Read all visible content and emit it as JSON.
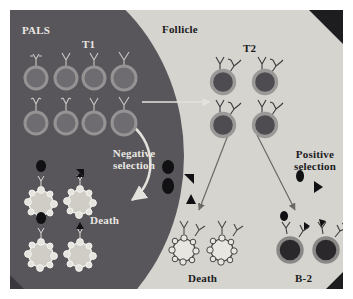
{
  "figure": {
    "regions": {
      "pals_label": "PALS",
      "follicle_label": "Follicle",
      "pals_color": "#58565a",
      "follicle_color": "#d6d4cf"
    },
    "stage_labels": {
      "t1": "T1",
      "t2": "T2"
    },
    "process_labels": {
      "negative_selection": "Negative\nselection",
      "positive_selection": "Positive\nselection"
    },
    "outcome_labels": {
      "death_pals": "Death",
      "death_follicle": "Death",
      "mature": "B-2"
    },
    "colors": {
      "t1_cell_ring": "#8f8d8e",
      "t1_cell_fill": "#6e6c70",
      "t2_cell_ring": "#9b9998",
      "t2_cell_fill": "#4e4c50",
      "b2_cell_ring": "#8a8886",
      "b2_cell_fill": "#2a282b",
      "apoptotic_pals_fill": "#cfcdc6",
      "apoptotic_follicle_fill": "#e8e6e1",
      "antigen_black": "#111113",
      "arrow_light": "#e4e2dd",
      "arrow_dark": "#6b6966"
    },
    "cell_groups": [
      {
        "name": "t1-cells",
        "stage": "T1",
        "region": "PALS",
        "count": 8,
        "style": "ring",
        "receptor": "IgM",
        "description": "Transitional type 1 B cells expressing surface IgM only"
      },
      {
        "name": "t2-cells",
        "stage": "T2",
        "region": "Follicle",
        "count": 4,
        "style": "thick-ring",
        "receptor": "IgM+IgD",
        "description": "Transitional type 2 B cells expressing IgM and IgD"
      },
      {
        "name": "apoptotic-pals-cells",
        "stage": "Death",
        "region": "PALS",
        "count": 4,
        "style": "blebbing",
        "receptor": "antigen-bound",
        "description": "Self-reactive B cells deleted by negative selection"
      },
      {
        "name": "apoptotic-follicle-cells",
        "stage": "Death",
        "region": "Follicle",
        "count": 2,
        "style": "blebbing",
        "receptor": "IgM+IgD",
        "description": "T2 cells failing positive selection"
      },
      {
        "name": "b2-cells",
        "stage": "B-2",
        "region": "Follicle",
        "count": 2,
        "style": "solid-dark",
        "receptor": "IgM+IgD with antigen",
        "description": "Mature follicular B-2 cells"
      }
    ],
    "free_antigens": [
      {
        "name": "antigen-cluster-pals",
        "region": "PALS",
        "count": 4
      },
      {
        "name": "antigen-cluster-follicle",
        "region": "Follicle",
        "count": 2
      }
    ],
    "arrows": [
      {
        "name": "arrow-t1-to-t2",
        "from": "T1",
        "to": "T2",
        "style": "straight",
        "color": "light"
      },
      {
        "name": "arrow-negative-selection",
        "from": "T1",
        "to": "Death",
        "style": "curved",
        "color": "light"
      },
      {
        "name": "arrow-t2-to-death",
        "from": "T2",
        "to": "Death",
        "style": "straight",
        "color": "dark"
      },
      {
        "name": "arrow-t2-to-b2",
        "from": "T2",
        "to": "B-2",
        "style": "straight",
        "color": "dark"
      }
    ]
  }
}
